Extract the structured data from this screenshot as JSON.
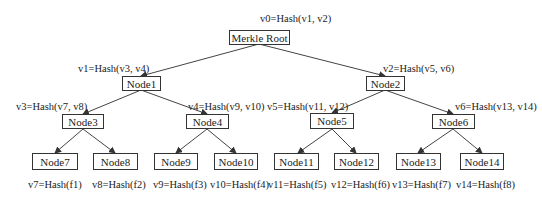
{
  "diagram": {
    "type": "merkle-tree",
    "nodes": {
      "root": {
        "label": "Merkle Root",
        "hash": "v0=Hash(v1, v2)"
      },
      "n1": {
        "label": "Node1",
        "hash": "v1=Hash(v3, v4)"
      },
      "n2": {
        "label": "Node2",
        "hash": "v2=Hash(v5, v6)"
      },
      "n3": {
        "label": "Node3",
        "hash": "v3=Hash(v7, v8)"
      },
      "n4": {
        "label": "Node4",
        "hash": "v4=Hash(v9, v10)"
      },
      "n5": {
        "label": "Node5",
        "hash": "v5=Hash(v11, v12)"
      },
      "n6": {
        "label": "Node6",
        "hash": "v6=Hash(v13, v14)"
      },
      "n7": {
        "label": "Node7",
        "hash": "v7=Hash(f1)"
      },
      "n8": {
        "label": "Node8",
        "hash": "v8=Hash(f2)"
      },
      "n9": {
        "label": "Node9",
        "hash": "v9=Hash(f3)"
      },
      "n10": {
        "label": "Node10",
        "hash": "v10=Hash(f4)"
      },
      "n11": {
        "label": "Node11",
        "hash": "v11=Hash(f5)"
      },
      "n12": {
        "label": "Node12",
        "hash": "v12=Hash(f6)"
      },
      "n13": {
        "label": "Node13",
        "hash": "v13=Hash(f7)"
      },
      "n14": {
        "label": "Node14",
        "hash": "v14=Hash(f8)"
      }
    },
    "edges": [
      [
        "root",
        "n1"
      ],
      [
        "root",
        "n2"
      ],
      [
        "n1",
        "n3"
      ],
      [
        "n1",
        "n4"
      ],
      [
        "n2",
        "n5"
      ],
      [
        "n2",
        "n6"
      ],
      [
        "n3",
        "n7"
      ],
      [
        "n3",
        "n8"
      ],
      [
        "n4",
        "n9"
      ],
      [
        "n4",
        "n10"
      ],
      [
        "n5",
        "n11"
      ],
      [
        "n5",
        "n12"
      ],
      [
        "n6",
        "n13"
      ],
      [
        "n6",
        "n14"
      ]
    ]
  }
}
